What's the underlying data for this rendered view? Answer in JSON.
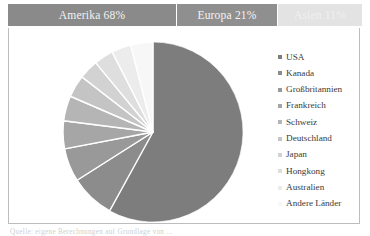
{
  "header": {
    "bands": [
      {
        "label": "Amerika 68%",
        "color": "#8a8a8a",
        "text_color": "#f2f2f2",
        "percent": 68
      },
      {
        "label": "Europa 21%",
        "color": "#8f8f8f",
        "text_color": "#f4f4f4",
        "percent": 21
      },
      {
        "label": "Asien 11%",
        "color": "#e3e3e3",
        "text_color": "#f0f0f0",
        "percent": 11
      }
    ]
  },
  "footer": {
    "text": "Quelle: eigene Berechnungen auf Grundlage von ..."
  },
  "legend": {
    "items": [
      {
        "label": "USA",
        "color": "#7d7d7d"
      },
      {
        "label": "Kanada",
        "color": "#8c8c8c"
      },
      {
        "label": "Großbritannien",
        "color": "#999999"
      },
      {
        "label": "Frankreich",
        "color": "#a6a6a6"
      },
      {
        "label": "Schweiz",
        "color": "#b5b5b5"
      },
      {
        "label": "Deutschland",
        "color": "#c4c4c4"
      },
      {
        "label": "Japan",
        "color": "#d2d2d2"
      },
      {
        "label": "Hongkong",
        "color": "#dedede"
      },
      {
        "label": "Australien",
        "color": "#ececec"
      },
      {
        "label": "Andere Länder",
        "color": "#f7f7f7"
      }
    ]
  },
  "chart_data": {
    "type": "pie",
    "title": "",
    "categories": [
      "USA",
      "Kanada",
      "Großbritannien",
      "Frankreich",
      "Schweiz",
      "Deutschland",
      "Japan",
      "Hongkong",
      "Australien",
      "Andere Länder"
    ],
    "values": [
      58,
      8,
      6,
      5,
      4.5,
      4,
      3.5,
      3.5,
      3.5,
      4
    ],
    "unit": "%",
    "colors": [
      "#7d7d7d",
      "#8c8c8c",
      "#999999",
      "#a6a6a6",
      "#b5b5b5",
      "#c4c4c4",
      "#d2d2d2",
      "#dedede",
      "#ececec",
      "#f7f7f7"
    ],
    "start_angle_deg": 0,
    "direction": "clockwise",
    "legend_position": "right",
    "slice_gap": true,
    "groups": [
      {
        "label": "Amerika",
        "percent": 68
      },
      {
        "label": "Europa",
        "percent": 21
      },
      {
        "label": "Asien",
        "percent": 11
      }
    ]
  }
}
